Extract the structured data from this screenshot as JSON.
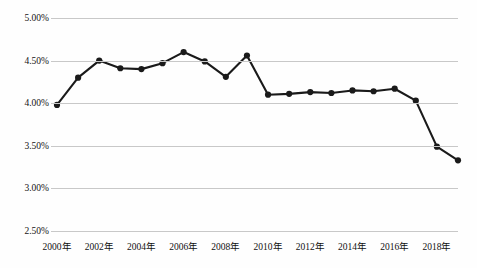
{
  "chart_data": {
    "type": "line",
    "title": "",
    "xlabel": "",
    "ylabel": "",
    "ylim": [
      2.5,
      5.0
    ],
    "ytick_labels": [
      "5.00%",
      "4.50%",
      "4.00%",
      "3.50%",
      "3.00%",
      "2.50%"
    ],
    "ytick_values": [
      5.0,
      4.5,
      4.0,
      3.5,
      3.0,
      2.5
    ],
    "xtick_labels": [
      "2000年",
      "2002年",
      "2004年",
      "2006年",
      "2008年",
      "2010年",
      "2012年",
      "2014年",
      "2016年",
      "2018年"
    ],
    "xtick_values": [
      2000,
      2002,
      2004,
      2006,
      2008,
      2010,
      2012,
      2014,
      2016,
      2018
    ],
    "x": [
      2000,
      2001,
      2002,
      2003,
      2004,
      2005,
      2006,
      2007,
      2008,
      2009,
      2010,
      2011,
      2012,
      2013,
      2014,
      2015,
      2016,
      2017,
      2018,
      2019
    ],
    "values": [
      3.98,
      4.3,
      4.5,
      4.41,
      4.4,
      4.47,
      4.6,
      4.49,
      4.31,
      4.56,
      4.1,
      4.11,
      4.13,
      4.12,
      4.15,
      4.14,
      4.17,
      4.03,
      3.49,
      3.33
    ],
    "grid": true,
    "legend": false,
    "line_color": "#1a1a1a",
    "marker": "circle",
    "marker_color": "#1a1a1a"
  }
}
